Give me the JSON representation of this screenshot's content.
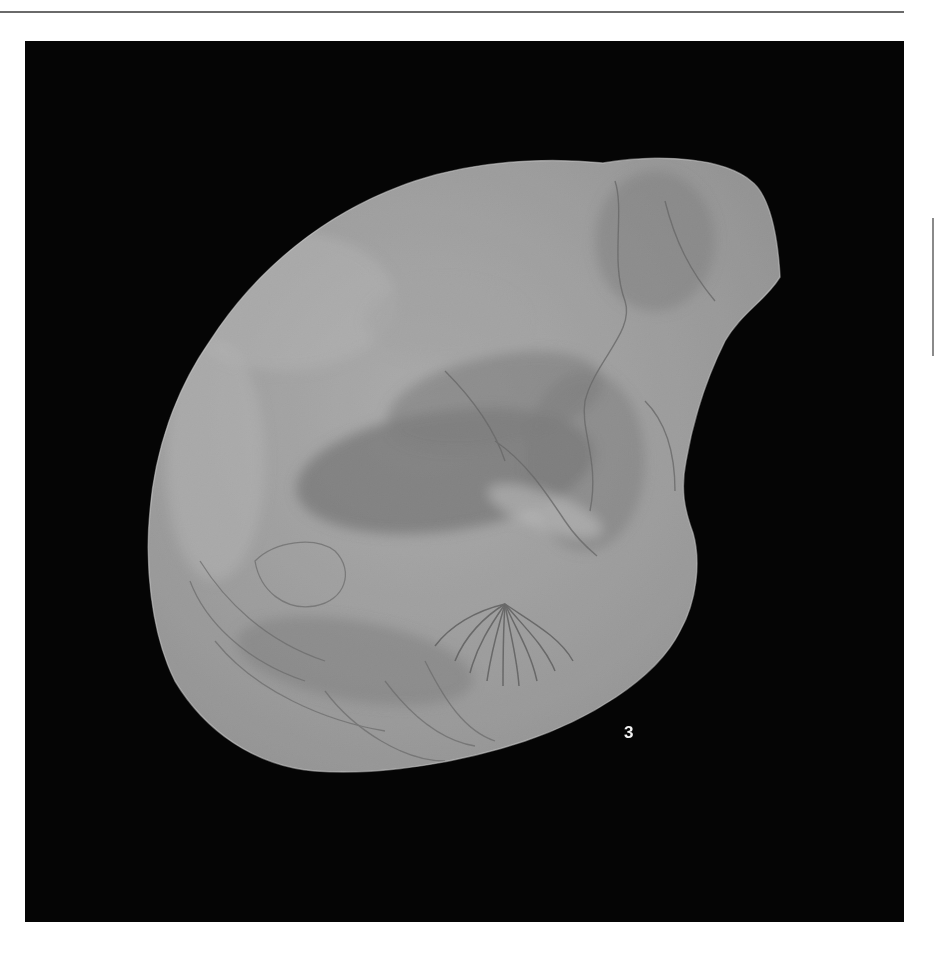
{
  "page": {
    "type": "monograph-plate",
    "background_color": "#ffffff",
    "rule_color": "#6a6a6a"
  },
  "plate": {
    "background_color": "#050505",
    "figure": {
      "label": "3",
      "subject": "fossil-shell-specimen",
      "label_color": "#f2f2f2",
      "shell_base_color": "#9a9a9a",
      "shell_light_color": "#c4c4c4",
      "shell_dark_color": "#6e6e6e"
    }
  }
}
